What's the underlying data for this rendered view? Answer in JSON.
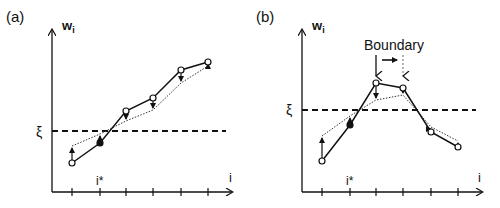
{
  "panels": [
    {
      "label": "(a)",
      "y_axis_label": "w",
      "y_axis_sub": "i",
      "x_axis_label": "i",
      "threshold_label": "ξ",
      "istar_label": "i*",
      "origin": [
        52,
        192
      ],
      "y_top": 30,
      "x_end": 232,
      "ticks_x": [
        72,
        100,
        126,
        153,
        181,
        208
      ],
      "threshold_y": 131,
      "solid_points": [
        [
          72,
          163
        ],
        [
          100,
          143
        ],
        [
          126,
          111
        ],
        [
          153,
          98
        ],
        [
          181,
          70
        ],
        [
          208,
          62
        ]
      ],
      "filled_index": 1,
      "dotted_points": [
        [
          72,
          146
        ],
        [
          100,
          134
        ],
        [
          126,
          121
        ],
        [
          153,
          110
        ],
        [
          181,
          83
        ],
        [
          208,
          66
        ]
      ]
    },
    {
      "label": "(b)",
      "y_axis_label": "w",
      "y_axis_sub": "i",
      "x_axis_label": "i",
      "threshold_label": "ξ",
      "istar_label": "i*",
      "boundary_label": "Boundary",
      "origin": [
        302,
        192
      ],
      "y_top": 30,
      "x_end": 482,
      "ticks_x": [
        322,
        350,
        376,
        403,
        431,
        458
      ],
      "threshold_y": 110,
      "solid_points": [
        [
          322,
          161
        ],
        [
          350,
          125
        ],
        [
          376,
          83
        ],
        [
          403,
          88
        ],
        [
          431,
          132
        ],
        [
          458,
          147
        ]
      ],
      "filled_index": 1,
      "dotted_points": [
        [
          322,
          136
        ],
        [
          350,
          116
        ],
        [
          376,
          100
        ],
        [
          403,
          95
        ],
        [
          431,
          127
        ],
        [
          458,
          141
        ]
      ]
    }
  ]
}
